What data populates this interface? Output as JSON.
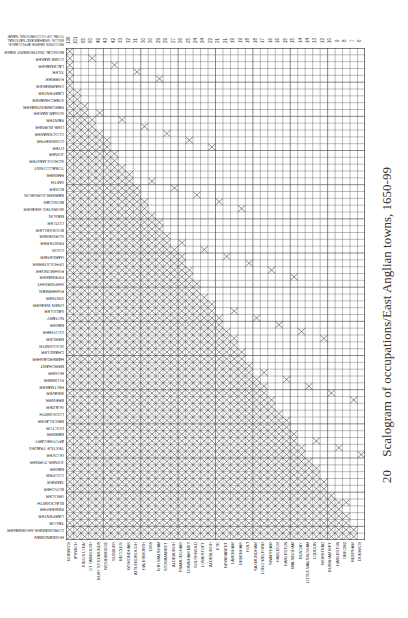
{
  "figure": {
    "number": "20",
    "caption": "Scalogram of occupations/East Anglian towns, 1650-99",
    "header_note": "RECORDS WHERE APPLICABLE: WILLIS, GRAHAM AND NATIONAL TOTAL OF OCCUPATIONS; NAME"
  },
  "chart_data": {
    "type": "heatmap",
    "title": "Scalogram of occupations/East Anglian towns, 1650-99",
    "xlabel": "Towns (ordered by number of occupations)",
    "ylabel": "Occupations (ordered by frequency)",
    "column_counts": [
      136,
      101,
      65,
      60,
      49,
      43,
      42,
      33,
      32,
      31,
      30,
      30,
      29,
      29,
      27,
      26,
      25,
      24,
      24,
      22,
      21,
      21,
      19,
      19,
      18,
      18,
      17,
      16,
      16,
      15,
      15,
      14,
      14,
      13,
      12,
      10,
      9,
      8,
      7,
      6
    ],
    "rows": 60,
    "columns": 40
  },
  "occupations": [
    "MUSICAL INSTRUMENT MAKER",
    "COMB MAKER",
    "LACEMAKER",
    "TILER",
    "FURRIER",
    "CHAIRMAKER",
    "CARPENTER",
    "STARCHMAKER",
    "PARCHMENTMAKER",
    "SUGAR-BAKER",
    "PAINTER",
    "LIME-BURNER",
    "CLOCKMAKER",
    "COWKEEPER",
    "DYER",
    "JOINER",
    "SCHOOLMASTER",
    "TOBACCONIST",
    "FARMER",
    "SMITH",
    "BOXER",
    "BARBER-SURGEON",
    "MUSICIAN",
    "WORSTED WEAVER",
    "MASON",
    "CUTLER",
    "BOOKSELLER",
    "SCRIVENER",
    "PEWTERER",
    "COOK",
    "GARDENER",
    "UPHOLSTERER",
    "FISHMONGER",
    "PIPEMAKER",
    "SHIPWRIGHT",
    "FISHERMAN",
    "VINTNER",
    "LINEN WEAVER",
    "SADDLER",
    "NOTARY",
    "BAKER",
    "CLOTHIER",
    "MERCER",
    "GOLDSMITH",
    "CHANDLER",
    "HABERDASHER",
    "MERCHANT",
    "HOSIER",
    "PLUMBER",
    "FELTMAKER",
    "WEAVER",
    "BREWER",
    "GLAZIER",
    "LOCKSMITH",
    "BRICKLAYER",
    "DOCTOR",
    "BARBER",
    "APOTHECARY",
    "TEXTILE TRADES",
    "GLOVER"
  ],
  "occupations_lower": [
    "JOINER-TURNER",
    "BAKER",
    "COOPER",
    "TANNER",
    "BUTCHER",
    "GROCER",
    "BLACKSMITH",
    "INNKEEPER",
    "CARPENTER",
    "TAILOR",
    "CORDWAINER-SHOEMAKER",
    "HUSBANDMAN"
  ],
  "towns": [
    "NORWICH",
    "IPSWICH",
    "KING'S LYNN",
    "GT YARMOUTH",
    "BURY ST EDMUNDS",
    "WOODBRIDGE",
    "SUDBURY",
    "BECCLES",
    "WYMONDHAM",
    "ATTLEBOROUGH",
    "HALESWORTH",
    "DISS",
    "NTH WALSHAM",
    "STOWMARKET",
    "ALDEBURGH",
    "FRAMLINGHAM",
    "DOWNHAM MKT",
    "SOUTHWOLD",
    "LOWESTOFT",
    "ALDEBURGH",
    "EYE",
    "NEWMARKET",
    "LAVENHAM",
    "DEBENHAM",
    "HOLT",
    "SAXMUNDHAM",
    "LONG MELFORD",
    "SWAFFHAM",
    "HADLEIGH",
    "HARLESTON",
    "WALSINGHAM",
    "BUNGAY",
    "LITTLE WALSINGHAM",
    "LODDON",
    "WORSTEAD",
    "BURNHAM MKT",
    "HARLESTON",
    "ORFORD",
    "REEPHAM",
    "DUNWICH"
  ]
}
